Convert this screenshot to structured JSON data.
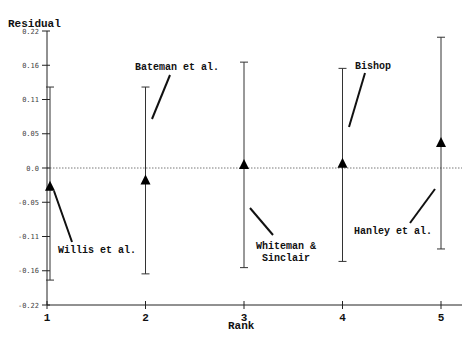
{
  "chart_data": {
    "type": "scatter",
    "title": "",
    "xlabel": "Rank",
    "ylabel": "Residual",
    "x_ticks": [
      "1",
      "2",
      "3",
      "4",
      "5"
    ],
    "y_ticks": [
      "0.22",
      "0.16",
      "0.11",
      "0.05",
      "0.0",
      "-0.05",
      "-0.11",
      "-0.16",
      "-0.22"
    ],
    "ylim": [
      -0.22,
      0.22
    ],
    "xlim": [
      1,
      5
    ],
    "grid": false,
    "reference_line": {
      "y": 0.0,
      "style": "dotted"
    },
    "series": [
      {
        "name": "Residuals with error bars",
        "marker": "triangle",
        "points": [
          {
            "rank": 1,
            "label": "Willis et al.",
            "value": -0.03,
            "lower": -0.18,
            "upper": 0.13
          },
          {
            "rank": 2,
            "label": "Bateman et al.",
            "value": -0.02,
            "lower": -0.17,
            "upper": 0.13
          },
          {
            "rank": 3,
            "label": "Whiteman & Sinclair",
            "value": 0.005,
            "lower": -0.16,
            "upper": 0.17
          },
          {
            "rank": 4,
            "label": "Bishop",
            "value": 0.007,
            "lower": -0.15,
            "upper": 0.16
          },
          {
            "rank": 5,
            "label": "Hanley et al.",
            "value": 0.04,
            "lower": -0.13,
            "upper": 0.21
          }
        ]
      }
    ]
  },
  "labels": {
    "ylabel": "Residual",
    "xlabel": "Rank",
    "ann_willis": "Willis et al.",
    "ann_bateman": "Bateman et al.",
    "ann_whiteman_1": "Whiteman &",
    "ann_whiteman_2": "Sinclair",
    "ann_bishop": "Bishop",
    "ann_hanley": "Hanley et al."
  }
}
